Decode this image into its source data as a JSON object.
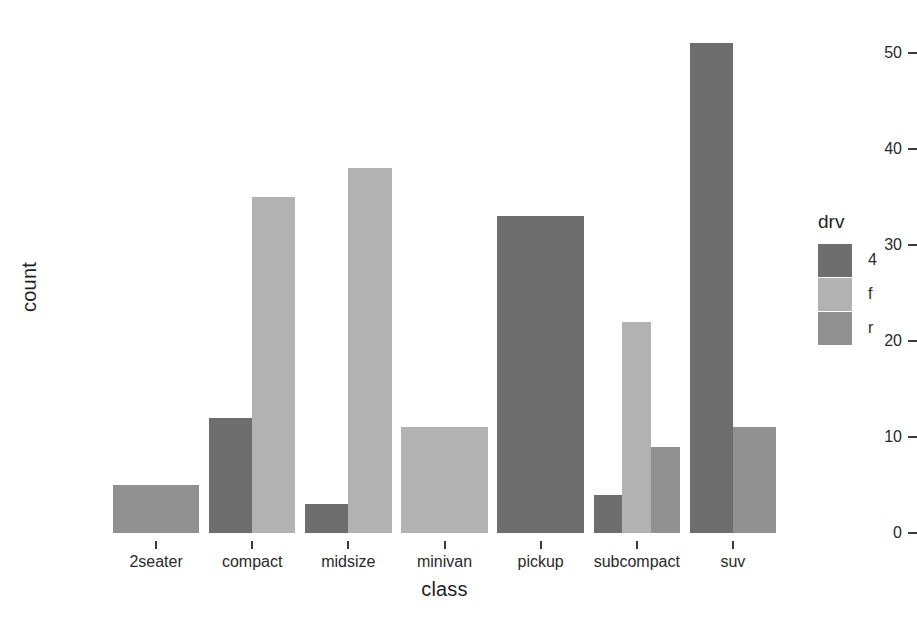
{
  "chart_data": {
    "type": "bar",
    "title": "",
    "subtitle": "",
    "xlabel": "class",
    "ylabel": "count",
    "categories": [
      "2seater",
      "compact",
      "midsize",
      "minivan",
      "pickup",
      "subcompact",
      "suv"
    ],
    "series": [
      {
        "name": "4",
        "color": "#6e6e6e",
        "values": [
          0,
          12,
          3,
          0,
          33,
          4,
          51
        ]
      },
      {
        "name": "f",
        "color": "#b2b2b2",
        "values": [
          0,
          35,
          38,
          11,
          0,
          22,
          0
        ]
      },
      {
        "name": "r",
        "color": "#909090",
        "values": [
          5,
          0,
          0,
          0,
          0,
          9,
          11
        ]
      }
    ],
    "legend": {
      "title": "drv",
      "position": "right",
      "entries": [
        {
          "label": "4",
          "color": "#6e6e6e"
        },
        {
          "label": "f",
          "color": "#b2b2b2"
        },
        {
          "label": "r",
          "color": "#909090"
        }
      ]
    },
    "yticks": [
      0,
      10,
      20,
      30,
      40,
      50
    ],
    "ytick_labels": [
      "0",
      "10",
      "20",
      "30",
      "40",
      "50"
    ],
    "ylim": [
      0,
      53
    ],
    "xtick_labels": [
      "2seater",
      "compact",
      "midsize",
      "minivan",
      "pickup",
      "subcompact",
      "suv"
    ],
    "grid": false,
    "background": "#ffffff",
    "position_mode": "dodge"
  }
}
